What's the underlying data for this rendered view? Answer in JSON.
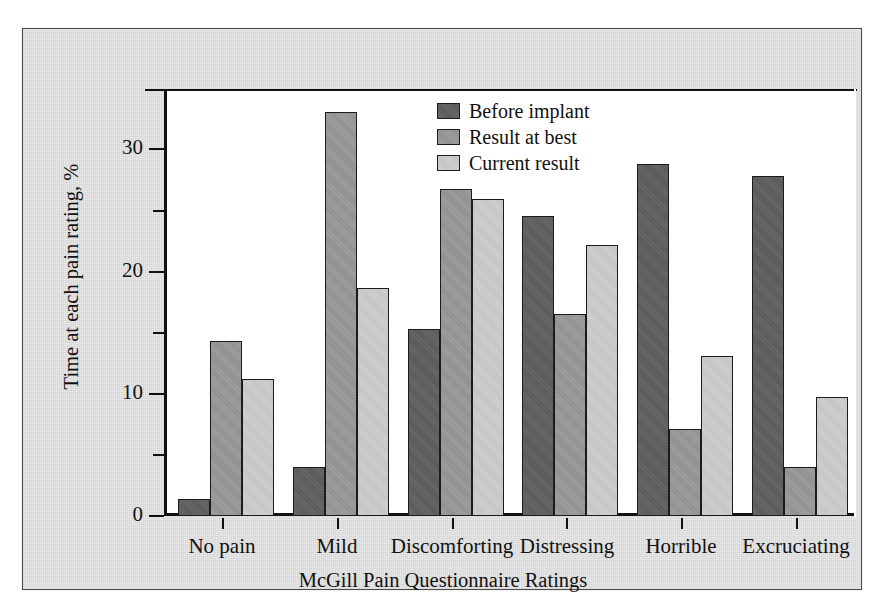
{
  "chart_data": {
    "type": "bar",
    "title": "",
    "xlabel": "McGill Pain Questionnaire Ratings",
    "ylabel": "Time at each pain rating, %",
    "categories": [
      "No pain",
      "Mild",
      "Discomforting",
      "Distressing",
      "Horrible",
      "Excruciating"
    ],
    "series": [
      {
        "name": "Before implant",
        "color": "#585858",
        "values": [
          1.4,
          4.0,
          15.4,
          24.7,
          29.0,
          28.0
        ]
      },
      {
        "name": "Result at best",
        "color": "#8e8e8e",
        "values": [
          14.4,
          33.3,
          26.9,
          16.6,
          7.2,
          4.0
        ]
      },
      {
        "name": "Current result",
        "color": "#c3c3c3",
        "values": [
          11.3,
          18.8,
          26.1,
          22.3,
          13.2,
          9.8
        ]
      }
    ],
    "ylim": [
      0,
      35
    ],
    "yticks": [
      0,
      10,
      20,
      30
    ],
    "yticks_minor": [
      5,
      15,
      25
    ],
    "ytick_labels": [
      "0",
      "10",
      "20",
      "30"
    ],
    "grid": false,
    "legend_position": "top-center"
  },
  "axis": {
    "y_title": "Time at each pain rating, %",
    "x_title": "McGill Pain Questionnaire Ratings",
    "y_labels": [
      "30",
      "20",
      "10",
      "0"
    ]
  },
  "legend": {
    "items": [
      {
        "label": "Before implant"
      },
      {
        "label": "Result at best"
      },
      {
        "label": "Current result"
      }
    ]
  }
}
